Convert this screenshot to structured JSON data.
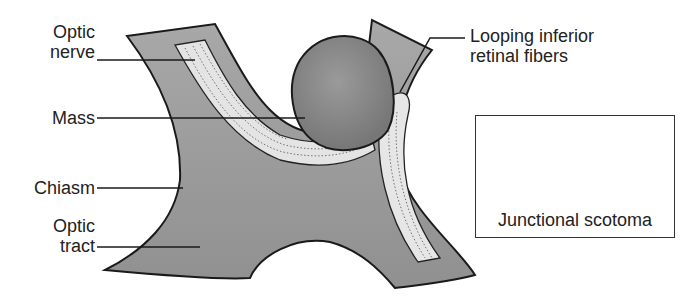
{
  "figure": {
    "labels": {
      "optic_nerve": [
        "Optic",
        "nerve"
      ],
      "mass": "Mass",
      "chiasm": "Chiasm",
      "optic_tract": [
        "Optic",
        "tract"
      ],
      "looping_fibers": [
        "Looping inferior",
        "retinal fibers"
      ]
    },
    "inset": {
      "caption": "Junctional scotoma",
      "fields": [
        {
          "name": "left-eye-field",
          "defect": "superior temporal quadrant shaded"
        },
        {
          "name": "right-eye-field",
          "defect": "central scotoma shaded"
        }
      ]
    },
    "colors": {
      "tissue": "#9a9a9a",
      "fibers": "#e6e6e6",
      "mass": "#8a8a8a",
      "line": "#1a1a1a",
      "shade": "#bdbdbd"
    }
  }
}
